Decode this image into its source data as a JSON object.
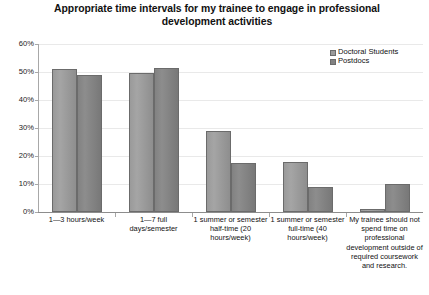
{
  "chart_data": {
    "type": "bar",
    "title": "Appropriate time intervals for my trainee to engage in professional development activities",
    "xlabel": "",
    "ylabel": "",
    "ylim": [
      0,
      60
    ],
    "ytick_labels": [
      "0%",
      "10%",
      "20%",
      "30%",
      "40%",
      "50%",
      "60%"
    ],
    "ytick_values": [
      0,
      10,
      20,
      30,
      40,
      50,
      60
    ],
    "grid": true,
    "legend_position": "top-right",
    "categories": [
      "1—3 hours/week",
      "1—7 full days/semester",
      "1 summer or semester half-time (20 hours/week)",
      "1 summer or semester full-time (40 hours/week)",
      "My trainee should not spend time on professional development outside of required coursework and research."
    ],
    "series": [
      {
        "name": "Doctoral Students",
        "color": "#9a9a9a",
        "values": [
          51,
          49.5,
          29,
          18,
          1
        ]
      },
      {
        "name": "Postdocs",
        "color": "#828282",
        "values": [
          49,
          51.5,
          17.5,
          9,
          10
        ]
      }
    ]
  }
}
